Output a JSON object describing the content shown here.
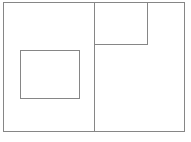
{
  "figure": {
    "title": "",
    "caption": "",
    "background_color": "#ffffff",
    "stroke_color": "#868686",
    "stroke_width": 1,
    "width": 191,
    "height": 142
  },
  "shapes": [
    {
      "name": "outer-rectangle",
      "role": "outer boundary rectangle",
      "x": 3,
      "y": 2.5,
      "width": 181,
      "height": 128.5,
      "label": ""
    },
    {
      "name": "vertical-divider",
      "role": "vertical dividing line splitting outer rectangle into left and right panels",
      "x1": 94,
      "y1": 2.5,
      "x2": 94,
      "y2": 131,
      "label": ""
    },
    {
      "name": "upper-right-inner-rectangle",
      "role": "rectangle in top-right panel attached to top edge and divider",
      "x": 94,
      "y": 2.5,
      "width": 53,
      "height": 42,
      "label": ""
    },
    {
      "name": "left-inner-square",
      "role": "free-standing square inside the left panel",
      "x": 20,
      "y": 50,
      "width": 59,
      "height": 48,
      "label": ""
    }
  ]
}
